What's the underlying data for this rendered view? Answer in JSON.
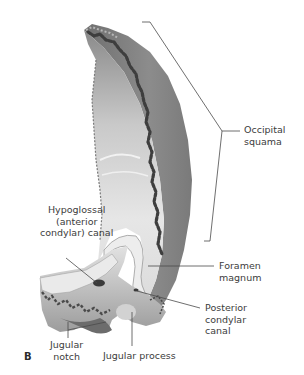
{
  "figure": {
    "panel_letter": "B",
    "labels": {
      "occipital_squama": "Occipital\nsquama",
      "hypoglossal_canal": "Hypoglossal\n(anterior\ncondylar) canal",
      "foramen_magnum": "Foramen\nmagnum",
      "posterior_condylar_canal": "Posterior\ncondylar\ncanal",
      "jugular_notch": "Jugular\nnotch",
      "jugular_process": "Jugular process"
    },
    "colors": {
      "background": "#ffffff",
      "leader_line": "#4a4a4a",
      "bone_outer": "#8a8a8a",
      "bone_inner": "#d8d8d8",
      "bone_dark": "#5e5e5e"
    }
  }
}
